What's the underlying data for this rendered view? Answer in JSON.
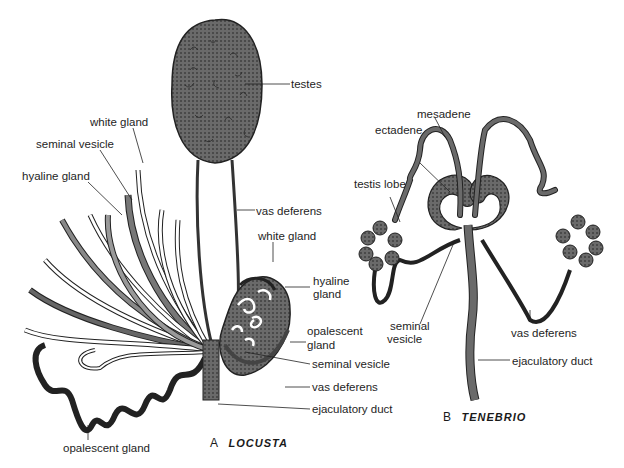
{
  "figure": {
    "panels": [
      {
        "letter": "A",
        "name": "LOCUSTA"
      },
      {
        "letter": "B",
        "name": "TENEBRIO"
      }
    ],
    "labels_a": {
      "testes": "testes",
      "white_gland_left": "white gland",
      "seminal_vesicle_left": "seminal vesicle",
      "hyaline_gland_left": "hyaline gland",
      "vas_deferens_top": "vas deferens",
      "white_gland_right": "white gland",
      "hyaline_gland_right_1": "hyaline",
      "hyaline_gland_right_2": "gland",
      "opalescent_gland_right_1": "opalescent",
      "opalescent_gland_right_2": "gland",
      "seminal_vesicle_right": "seminal vesicle",
      "vas_deferens_bottom": "vas deferens",
      "ejaculatory_duct": "ejaculatory duct",
      "opalescent_gland_bottom": "opalescent gland"
    },
    "labels_b": {
      "mesadene": "mesadene",
      "ectadene": "ectadene",
      "testis_lobe": "testis lobe",
      "seminal_vesicle_1": "seminal",
      "seminal_vesicle_2": "vesicle",
      "vas_deferens": "vas deferens",
      "ejaculatory_duct": "ejaculatory duct"
    },
    "colors": {
      "tissue": "#5a5a5a",
      "outline": "#1a1a1a",
      "paper": "#ffffff"
    }
  }
}
